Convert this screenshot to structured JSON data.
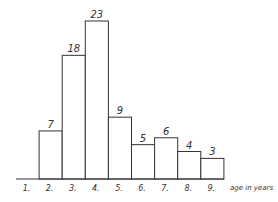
{
  "chart_data": {
    "type": "bar",
    "title": "",
    "xlabel": "age in years",
    "ylabel": "",
    "categories": [
      "1.",
      "2.",
      "3.",
      "4.",
      "5.",
      "6.",
      "7.",
      "8.",
      "9."
    ],
    "values": [
      0,
      7,
      18,
      23,
      9,
      5,
      6,
      4,
      3
    ],
    "data_labels": [
      "",
      "7",
      "18",
      "23",
      "9",
      "5",
      "6",
      "4",
      "3"
    ],
    "ylim": [
      0,
      23
    ],
    "grid": false,
    "legend": null,
    "bar_style": "outlined, white fill, adjacent (histogram)"
  },
  "colors": {
    "stroke": "#333333",
    "fill": "#ffffff",
    "text": "#333333"
  }
}
